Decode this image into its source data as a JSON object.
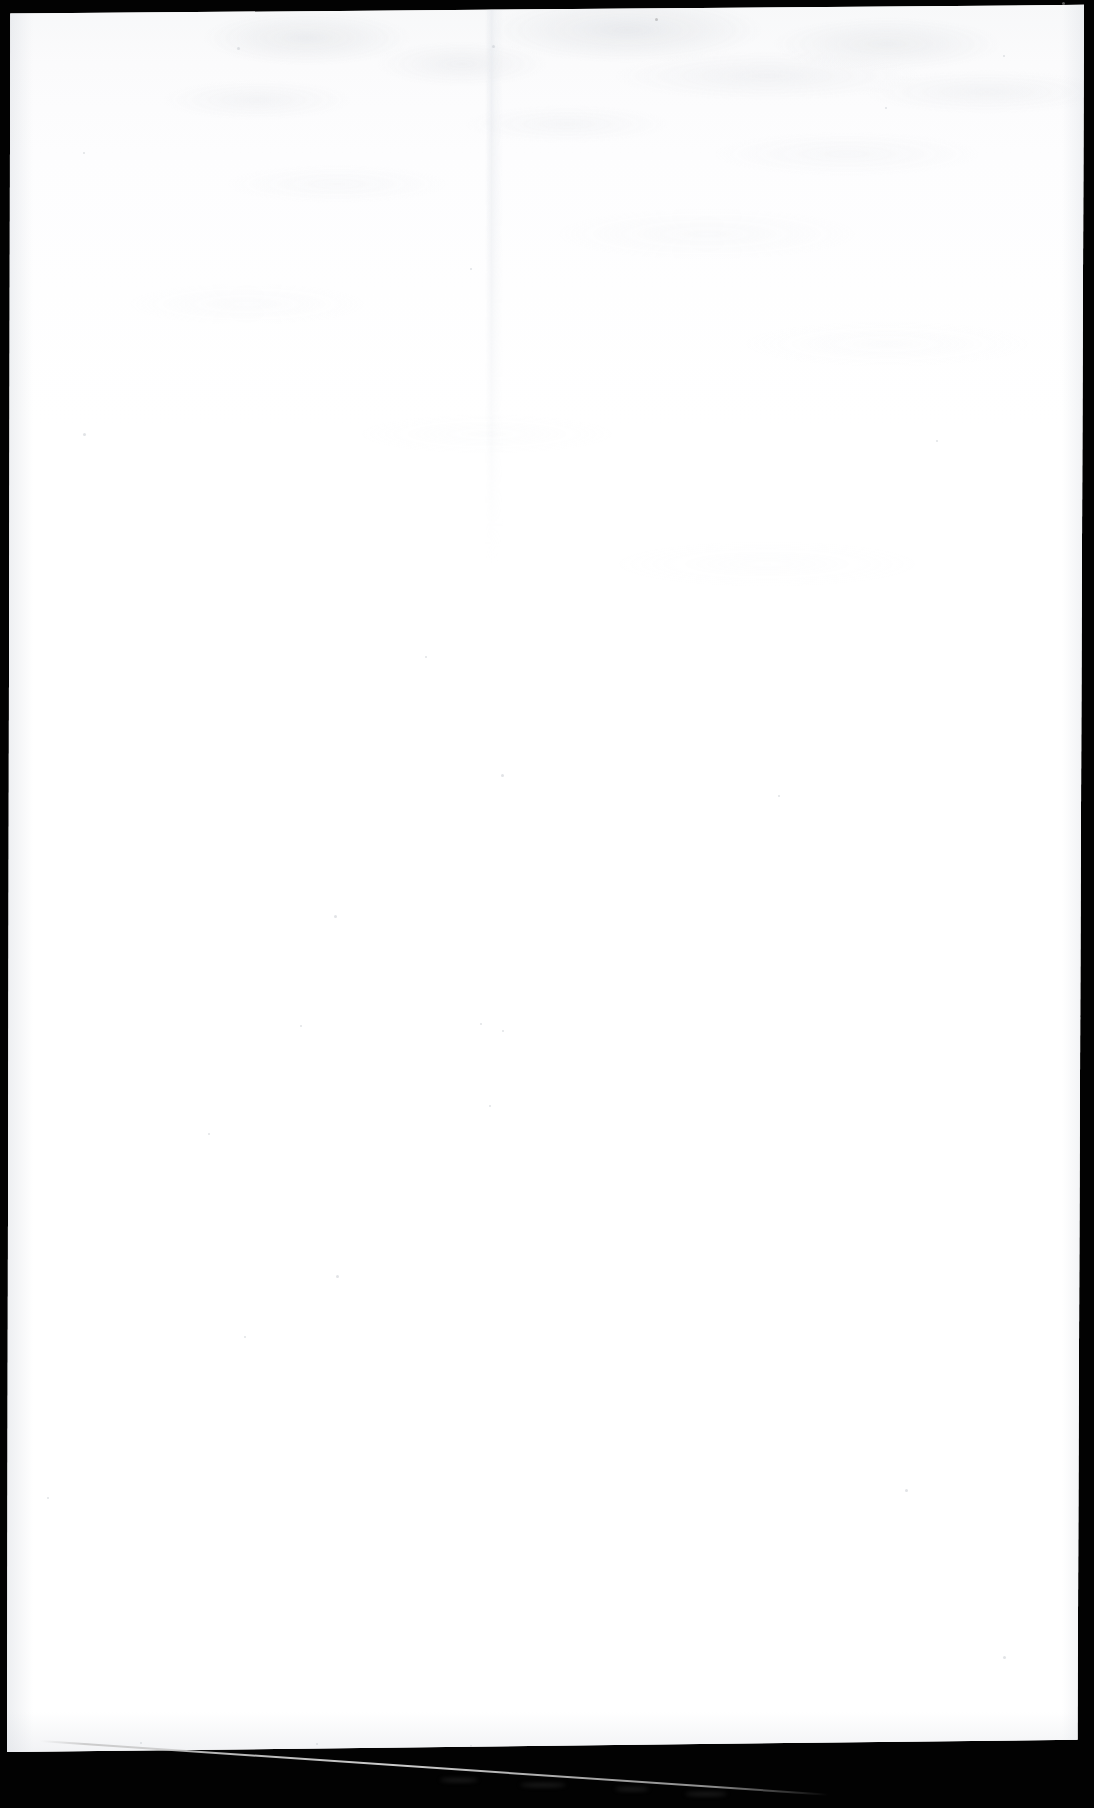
{
  "document": {
    "kind": "scanned-page-image",
    "page_state": "blank",
    "visible_text": "",
    "orientation": "portrait",
    "canvas": {
      "width": 1094,
      "height": 1808
    }
  },
  "colors": {
    "scanner_background": "#020202",
    "paper_white": "#fefefe",
    "paper_tint_top": "#f7f8f9",
    "bleed_through_gray": "#c6cad0",
    "streak_gray": "#d6d6d6",
    "speck_gray": "#c9ccd2"
  },
  "page_sheet": {
    "left": 7,
    "top": 4,
    "width": 1077,
    "height": 1748,
    "skew_note": "page tilted slightly; bottom-left lower than bottom-right"
  },
  "borders": {
    "top_band_height_left": 12,
    "top_band_height_right": 3,
    "left_band_width": 8,
    "right_band_width_top": 10,
    "right_band_width_bottom": 22,
    "bottom_band_height": 58
  },
  "artifacts": {
    "seam": {
      "name": "vertical-scanner-seam",
      "x": 487,
      "top": 0,
      "height": 560
    },
    "streak": {
      "name": "diagonal-light-streak",
      "start_x": 48,
      "start_y": 1757,
      "end_x": 830,
      "end_y": 1806,
      "color": "#d6d6d6"
    },
    "specks": [
      {
        "x": 237,
        "y": 47,
        "size": 3
      },
      {
        "x": 492,
        "y": 45,
        "size": 3
      },
      {
        "x": 1003,
        "y": 55,
        "size": 2
      },
      {
        "x": 885,
        "y": 107,
        "size": 2
      },
      {
        "x": 83,
        "y": 152,
        "size": 2
      },
      {
        "x": 470,
        "y": 268,
        "size": 2
      },
      {
        "x": 83,
        "y": 433,
        "size": 3
      },
      {
        "x": 936,
        "y": 440,
        "size": 2
      },
      {
        "x": 425,
        "y": 656,
        "size": 2
      },
      {
        "x": 501,
        "y": 774,
        "size": 3
      },
      {
        "x": 778,
        "y": 795,
        "size": 2
      },
      {
        "x": 334,
        "y": 915,
        "size": 3
      },
      {
        "x": 300,
        "y": 1025,
        "size": 2
      },
      {
        "x": 480,
        "y": 1023,
        "size": 2
      },
      {
        "x": 502,
        "y": 1030,
        "size": 2
      },
      {
        "x": 489,
        "y": 1105,
        "size": 2
      },
      {
        "x": 208,
        "y": 1133,
        "size": 2
      },
      {
        "x": 336,
        "y": 1275,
        "size": 3
      },
      {
        "x": 905,
        "y": 1489,
        "size": 3
      },
      {
        "x": 47,
        "y": 1497,
        "size": 2
      },
      {
        "x": 244,
        "y": 1336,
        "size": 2
      },
      {
        "x": 1003,
        "y": 1656,
        "size": 3
      },
      {
        "x": 140,
        "y": 1742,
        "size": 2
      },
      {
        "x": 316,
        "y": 1743,
        "size": 2
      },
      {
        "x": 470,
        "y": 1745,
        "size": 2
      }
    ],
    "edge_dots": [
      {
        "x": 655,
        "y": 18
      },
      {
        "x": 1062,
        "y": 2
      }
    ],
    "streak_smudges": [
      {
        "x": 440,
        "y": 1778,
        "w": 38,
        "h": 4
      },
      {
        "x": 520,
        "y": 1783,
        "w": 46,
        "h": 4
      },
      {
        "x": 615,
        "y": 1787,
        "w": 34,
        "h": 4
      },
      {
        "x": 685,
        "y": 1792,
        "w": 42,
        "h": 4
      }
    ]
  }
}
